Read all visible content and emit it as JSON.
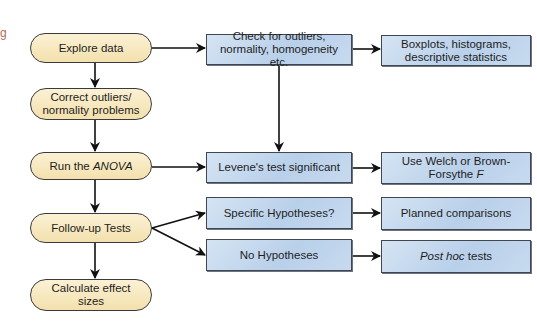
{
  "corner_text": "g",
  "ovals": [
    {
      "label": "Explore data"
    },
    {
      "label": "Correct outliers/ normality problems"
    },
    {
      "label_prefix": "Run the ",
      "label_italic": "ANOVA"
    },
    {
      "label": "Follow-up Tests"
    },
    {
      "label": "Calculate effect sizes"
    }
  ],
  "column1": [
    {
      "label": "Check for outliers, normality, homogeneity etc."
    },
    {
      "label": "Levene's test significant"
    },
    {
      "label": "Specific Hypotheses?"
    },
    {
      "label": "No Hypotheses"
    }
  ],
  "column2": [
    {
      "label": "Boxplots, histograms, descriptive statistics"
    },
    {
      "label_prefix": "Use Welch or Brown-Forsythe ",
      "label_italic": "F"
    },
    {
      "label": "Planned comparisons"
    },
    {
      "label_italic": "Post hoc",
      "label_suffix": " tests"
    }
  ],
  "colors": {
    "oval_fill": "#f5e4b5",
    "rect_fill": "#c3d7ed",
    "stroke": "#1a1a1a"
  }
}
